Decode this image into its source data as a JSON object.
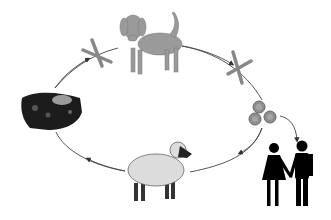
{
  "diagram": {
    "type": "life-cycle",
    "nodes": [
      {
        "id": "dog",
        "label": "dog",
        "icon": "dog-icon"
      },
      {
        "id": "parasite-right",
        "label": "parasite cross marker",
        "icon": "cross-marker-icon"
      },
      {
        "id": "eggs",
        "label": "eggs",
        "icon": "eggs-icon"
      },
      {
        "id": "sheep",
        "label": "sheep",
        "icon": "sheep-icon"
      },
      {
        "id": "cyst-tissue",
        "label": "infected tissue",
        "icon": "tissue-icon"
      },
      {
        "id": "parasite-left",
        "label": "parasite cross marker",
        "icon": "cross-marker-icon"
      },
      {
        "id": "humans",
        "label": "humans",
        "icon": "people-icon"
      }
    ],
    "edges": [
      {
        "from": "cyst-tissue",
        "to": "dog"
      },
      {
        "from": "dog",
        "to": "eggs"
      },
      {
        "from": "eggs",
        "to": "sheep"
      },
      {
        "from": "sheep",
        "to": "cyst-tissue"
      },
      {
        "from": "eggs",
        "to": "humans"
      }
    ],
    "colors": {
      "line": "#444444",
      "animal": "#9a9a9a",
      "sheep_body": "#dcdcdc",
      "dark": "#111111"
    }
  }
}
